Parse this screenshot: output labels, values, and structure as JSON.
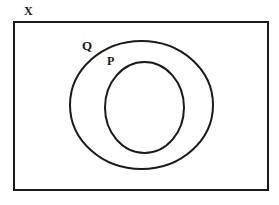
{
  "diagram": {
    "type": "euler-diagram",
    "background_color": "#ffffff",
    "stroke_color": "#1a1a1a",
    "fill_color": "none",
    "labels": {
      "universe": "X",
      "outer_set": "Q",
      "inner_set": "P"
    },
    "shapes": {
      "universe_rect": {
        "name": "X",
        "kind": "rectangle",
        "x": 14,
        "y": 22,
        "width": 254,
        "height": 168,
        "stroke_width": 2
      },
      "outer_ellipse": {
        "name": "Q",
        "kind": "ellipse",
        "cx": 141.5,
        "cy": 105,
        "rx": 71.5,
        "ry": 64,
        "stroke_width": 2
      },
      "inner_ellipse": {
        "name": "P",
        "kind": "ellipse",
        "cx": 144.5,
        "cy": 107.5,
        "rx": 39.5,
        "ry": 45.5,
        "stroke_width": 2
      }
    }
  }
}
